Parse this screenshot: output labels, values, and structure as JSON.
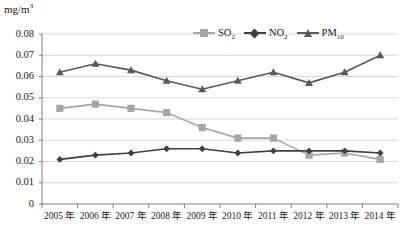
{
  "chart_data": {
    "type": "line",
    "title": "",
    "subtitle": "",
    "xlabel": "",
    "ylabel": "mg/m3",
    "unit_label": "mg/m",
    "unit_exponent": "3",
    "categories": [
      "2005 年",
      "2006 年",
      "2007 年",
      "2008 年",
      "2009 年",
      "2010 年",
      "2011 年",
      "2012 年",
      "2013 年",
      "2014 年"
    ],
    "ylim": [
      0,
      0.08
    ],
    "ytick_values": [
      0,
      0.01,
      0.02,
      0.03,
      0.04,
      0.05,
      0.06,
      0.07,
      0.08
    ],
    "ytick_labels": [
      "0",
      "0.01",
      "0.02",
      "0.03",
      "0.04",
      "0.05",
      "0.06",
      "0.07",
      "0.08"
    ],
    "grid": true,
    "grid_axis": "y",
    "legend_position": "top-right",
    "series": [
      {
        "name": "SO2",
        "label_base": "SO",
        "label_sub": "2",
        "marker": "square",
        "color": "#a6a6a6",
        "marker_color": "#a6a6a6",
        "values": [
          0.045,
          0.047,
          0.045,
          0.043,
          0.036,
          0.031,
          0.031,
          0.023,
          0.024,
          0.021
        ]
      },
      {
        "name": "NO2",
        "label_base": "NO",
        "label_sub": "2",
        "marker": "diamond",
        "color": "#404040",
        "marker_color": "#404040",
        "values": [
          0.021,
          0.023,
          0.024,
          0.026,
          0.026,
          0.024,
          0.025,
          0.025,
          0.025,
          0.024
        ]
      },
      {
        "name": "PM10",
        "label_base": "PM",
        "label_sub": "10",
        "marker": "triangle",
        "color": "#595959",
        "marker_color": "#595959",
        "values": [
          0.062,
          0.066,
          0.063,
          0.058,
          0.054,
          0.058,
          0.062,
          0.057,
          0.062,
          0.07
        ]
      }
    ]
  },
  "colors": {
    "axis": "#808080",
    "grid": "#d9d9d9",
    "text": "#1a1a1a",
    "background": "#ffffff"
  }
}
